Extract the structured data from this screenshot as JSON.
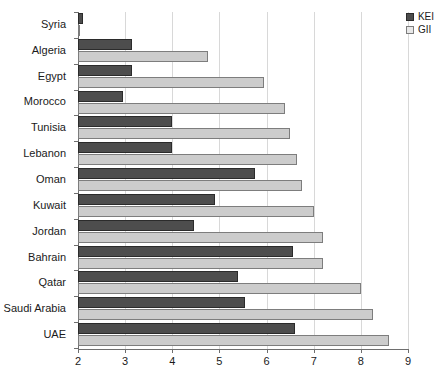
{
  "chart_data": {
    "type": "bar",
    "orientation": "horizontal",
    "title": "",
    "subtitle": "",
    "xlabel": "",
    "ylabel": "",
    "xlim": [
      2,
      9
    ],
    "xticks": [
      2,
      3,
      4,
      5,
      6,
      7,
      8,
      9
    ],
    "xtick_labels": [
      "2",
      "3",
      "4",
      "5",
      "6",
      "7",
      "8",
      "9"
    ],
    "grid": true,
    "grid_axis": "x",
    "legend_position": "top-right",
    "categories": [
      "Syria",
      "Algeria",
      "Egypt",
      "Morocco",
      "Tunisia",
      "Lebanon",
      "Oman",
      "Kuwait",
      "Jordan",
      "Bahrain",
      "Qatar",
      "Saudi Arabia",
      "UAE"
    ],
    "series": [
      {
        "name": "KEI",
        "color": "#4d4d4d",
        "values": [
          2.1,
          3.15,
          3.15,
          2.95,
          4.0,
          4.0,
          5.75,
          4.9,
          4.45,
          6.55,
          5.4,
          5.55,
          6.6
        ]
      },
      {
        "name": "GII",
        "color": "#cccccc",
        "values": [
          2.05,
          4.75,
          5.95,
          6.4,
          6.5,
          6.65,
          6.75,
          7.0,
          7.2,
          7.2,
          8.0,
          8.25,
          8.6
        ]
      }
    ]
  },
  "legend": {
    "entries": [
      {
        "label": "KEI",
        "swatch": "filled-dark-square-icon"
      },
      {
        "label": "GII",
        "swatch": "outlined-light-square-icon"
      }
    ]
  }
}
